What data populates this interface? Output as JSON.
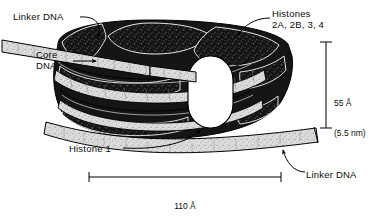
{
  "figure": {
    "background_color": "#ffffff",
    "ink_color": "#000000",
    "dna_fill_color": "#d8d8d8",
    "histone_fill_color": "#1a1a1a",
    "histone1_fill_color": "#ffffff"
  },
  "labels": {
    "linker_dna_top": "Linker DNA",
    "core_dna": "Core\nDNA",
    "histones": "Histones\n2A, 2B, 3, 4",
    "histone_1": "Histone 1",
    "linker_dna_bottom": "Linker DNA"
  },
  "dimensions": {
    "height": {
      "value": "55 Å",
      "nanometers": "(5.5 nm)",
      "orientation": "vertical"
    },
    "width": {
      "value": "110 Å",
      "nanometers": "(11 nm)",
      "orientation": "horizontal"
    }
  },
  "icons": {
    "leader_arrow": "arrow-icon",
    "dimension_bar": "dimension-bar-icon"
  }
}
